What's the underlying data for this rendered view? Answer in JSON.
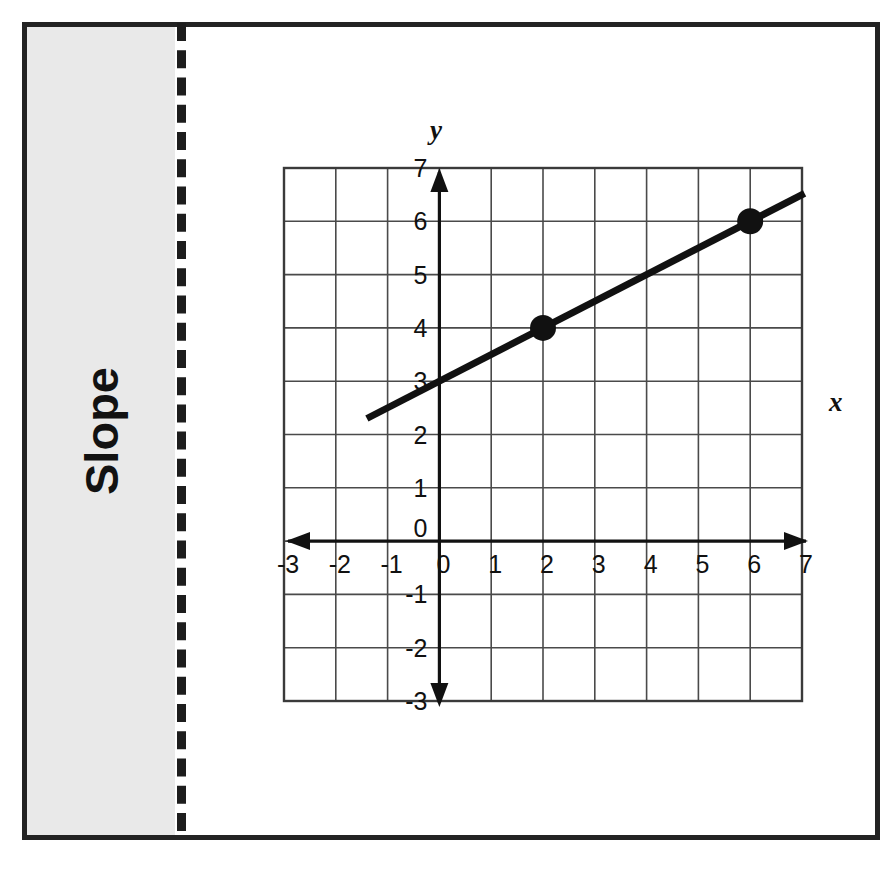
{
  "page": {
    "background_color": "#ffffff",
    "frame_border_color": "#232323"
  },
  "sidebar": {
    "title": "Slope",
    "background_color": "#e9e9e9",
    "text_color": "#121212",
    "orientation": "vertical-rotated"
  },
  "divider": {
    "style": "dashed",
    "color": "#1d1d1d"
  },
  "chart_data": {
    "type": "line",
    "title": "Slope",
    "xlabel": "x",
    "ylabel": "y",
    "xlim": [
      -3,
      7
    ],
    "ylim": [
      -3,
      7
    ],
    "xticks": [
      "-3",
      "-2",
      "-1",
      "0",
      "1",
      "2",
      "3",
      "4",
      "5",
      "6",
      "7"
    ],
    "yticks": [
      "-3",
      "-2",
      "-1",
      "0",
      "1",
      "2",
      "3",
      "4",
      "5",
      "6",
      "7"
    ],
    "xtick_values": [
      -3,
      -2,
      -1,
      0,
      1,
      2,
      3,
      4,
      5,
      6,
      7
    ],
    "ytick_values": [
      -3,
      -2,
      -1,
      0,
      1,
      2,
      3,
      4,
      5,
      6,
      7
    ],
    "grid": true,
    "grid_color": "#4a4a4a",
    "grid_spacing": 1,
    "legend": false,
    "axis_arrows": "both-ends",
    "line_color": "#111111",
    "point_color": "#111111",
    "series": [
      {
        "name": "line",
        "equation": "y = 0.5x + 3",
        "slope": 0.5,
        "intercept": 3,
        "x_start": -1.4,
        "y_start": 2.3,
        "x_end": 7.05,
        "y_end": 6.525
      }
    ],
    "marked_points": [
      {
        "label": "(2, 4)",
        "x": 2,
        "y": 4
      },
      {
        "label": "(6, 6)",
        "x": 6,
        "y": 6
      }
    ]
  }
}
